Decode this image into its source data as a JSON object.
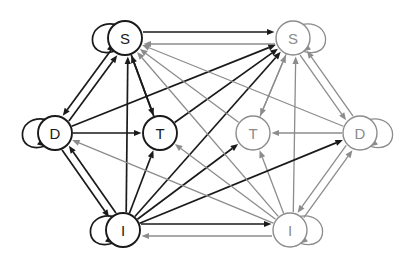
{
  "diagram": {
    "type": "directed-graph",
    "width": 414,
    "height": 264,
    "background": "#ffffff",
    "colors": {
      "cluster_a": "#1a1a1a",
      "cluster_b": "#8c8c8c",
      "node_fill": "#ffffff"
    },
    "node_radius": 17,
    "nodes": [
      {
        "id": "S1",
        "label": "S",
        "x": 125,
        "y": 38,
        "cluster": "a",
        "color": "#1a1a1a",
        "self_loop": true,
        "loop_side": "left"
      },
      {
        "id": "S2",
        "label": "S",
        "x": 293,
        "y": 38,
        "cluster": "b",
        "color": "#8c8c8c",
        "self_loop": true,
        "loop_side": "right"
      },
      {
        "id": "D1",
        "label": "D",
        "x": 55,
        "y": 133,
        "cluster": "a",
        "color": "#1a1a1a",
        "self_loop": true,
        "loop_side": "left"
      },
      {
        "id": "T1",
        "label": "T",
        "x": 160,
        "y": 133,
        "cluster": "a",
        "color": "#1a1a1a",
        "self_loop": false,
        "loop_side": ""
      },
      {
        "id": "T2",
        "label": "T",
        "x": 253,
        "y": 133,
        "cluster": "b",
        "color": "#8c8c8c",
        "self_loop": false,
        "loop_side": ""
      },
      {
        "id": "D2",
        "label": "D",
        "x": 360,
        "y": 133,
        "cluster": "b",
        "color": "#8c8c8c",
        "self_loop": true,
        "loop_side": "right"
      },
      {
        "id": "I1",
        "label": "I",
        "x": 123,
        "y": 230,
        "cluster": "a",
        "color": "#1a1a1a",
        "self_loop": true,
        "loop_side": "left"
      },
      {
        "id": "I2",
        "label": "I",
        "x": 290,
        "y": 230,
        "cluster": "b",
        "color": "#8c8c8c",
        "self_loop": true,
        "loop_side": "right"
      }
    ],
    "edges": [
      {
        "from": "S1",
        "to": "S2",
        "color": "#1a1a1a",
        "offset": -6
      },
      {
        "from": "S2",
        "to": "S1",
        "color": "#8c8c8c",
        "offset": -6
      },
      {
        "from": "I1",
        "to": "I2",
        "color": "#1a1a1a",
        "offset": -6
      },
      {
        "from": "I2",
        "to": "I1",
        "color": "#8c8c8c",
        "offset": -6
      },
      {
        "from": "S1",
        "to": "D1",
        "color": "#1a1a1a",
        "offset": 4
      },
      {
        "from": "D1",
        "to": "S1",
        "color": "#1a1a1a",
        "offset": 4
      },
      {
        "from": "S1",
        "to": "T1",
        "color": "#1a1a1a",
        "offset": 0
      },
      {
        "from": "T1",
        "to": "S1",
        "color": "#1a1a1a",
        "offset": 0
      },
      {
        "from": "D1",
        "to": "T1",
        "color": "#1a1a1a",
        "offset": 0
      },
      {
        "from": "D1",
        "to": "I1",
        "color": "#1a1a1a",
        "offset": 4
      },
      {
        "from": "I1",
        "to": "D1",
        "color": "#1a1a1a",
        "offset": 4
      },
      {
        "from": "I1",
        "to": "S1",
        "color": "#1a1a1a",
        "offset": 3
      },
      {
        "from": "I1",
        "to": "T1",
        "color": "#1a1a1a",
        "offset": 0
      },
      {
        "from": "S2",
        "to": "D2",
        "color": "#8c8c8c",
        "offset": 4
      },
      {
        "from": "D2",
        "to": "S2",
        "color": "#8c8c8c",
        "offset": 4
      },
      {
        "from": "S2",
        "to": "T2",
        "color": "#8c8c8c",
        "offset": 0
      },
      {
        "from": "T2",
        "to": "S2",
        "color": "#8c8c8c",
        "offset": 0
      },
      {
        "from": "D2",
        "to": "T2",
        "color": "#8c8c8c",
        "offset": 0
      },
      {
        "from": "D2",
        "to": "I2",
        "color": "#8c8c8c",
        "offset": 4
      },
      {
        "from": "I2",
        "to": "D2",
        "color": "#8c8c8c",
        "offset": 4
      },
      {
        "from": "I2",
        "to": "S2",
        "color": "#8c8c8c",
        "offset": 3
      },
      {
        "from": "I2",
        "to": "T2",
        "color": "#8c8c8c",
        "offset": 0
      },
      {
        "from": "I1",
        "to": "S2",
        "color": "#1a1a1a",
        "offset": 0
      },
      {
        "from": "I1",
        "to": "T2",
        "color": "#1a1a1a",
        "offset": 0
      },
      {
        "from": "I1",
        "to": "D2",
        "color": "#1a1a1a",
        "offset": 0
      },
      {
        "from": "D1",
        "to": "S2",
        "color": "#1a1a1a",
        "offset": 0
      },
      {
        "from": "T1",
        "to": "S2",
        "color": "#1a1a1a",
        "offset": 0
      },
      {
        "from": "I2",
        "to": "S1",
        "color": "#8c8c8c",
        "offset": 0
      },
      {
        "from": "I2",
        "to": "T1",
        "color": "#8c8c8c",
        "offset": 0
      },
      {
        "from": "I2",
        "to": "D1",
        "color": "#8c8c8c",
        "offset": 0
      },
      {
        "from": "D2",
        "to": "S1",
        "color": "#8c8c8c",
        "offset": 0
      },
      {
        "from": "T2",
        "to": "S1",
        "color": "#8c8c8c",
        "offset": 0
      }
    ]
  }
}
